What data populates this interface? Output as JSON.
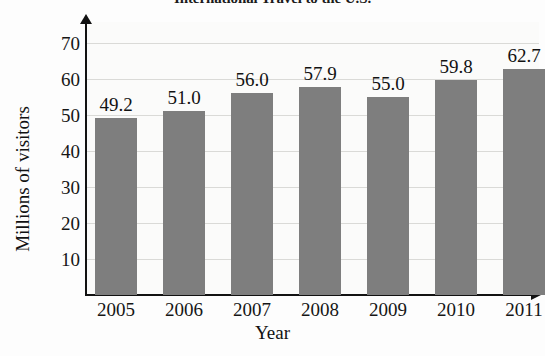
{
  "chart_data": {
    "type": "bar",
    "title": "International Travel to the U.S.",
    "xlabel": "Year",
    "ylabel": "Millions of visitors",
    "categories": [
      "2005",
      "2006",
      "2007",
      "2008",
      "2009",
      "2010",
      "2011"
    ],
    "values": [
      49.2,
      51.0,
      56.0,
      57.9,
      55.0,
      59.8,
      62.7
    ],
    "value_labels": [
      "49.2",
      "51.0",
      "56.0",
      "57.9",
      "55.0",
      "59.8",
      "62.7"
    ],
    "ylim": [
      0,
      75
    ],
    "yticks": [
      10,
      20,
      30,
      40,
      50,
      60,
      70
    ],
    "ytick_labels": [
      "10",
      "20",
      "30",
      "40",
      "50",
      "60",
      "70"
    ],
    "grid": true,
    "legend": false,
    "bar_color": "#7e7e7e",
    "axis_color": "#121212",
    "gridline_color": "#cfcfcb",
    "plot_background": "#fbfbfa"
  }
}
